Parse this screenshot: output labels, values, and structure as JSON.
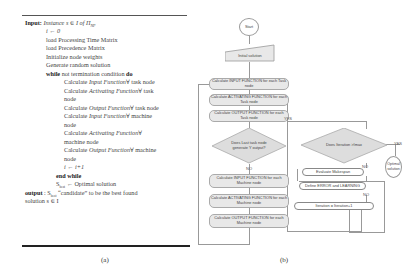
{
  "algorithm": {
    "lines": [
      {
        "kw": "Input:",
        "text": " Instance  s ∈ I of Π",
        "sub": "NP"
      },
      {
        "text": "i ← 0"
      },
      {
        "text": "load Processing Time Matrix"
      },
      {
        "text": "load Precedence Matrix"
      },
      {
        "text": "Initialize node weights"
      },
      {
        "text": "Generate random solution"
      },
      {
        "kw": "while",
        "text": "  not termination condition ",
        "kw2": "do"
      },
      {
        "pre": "Calculate ",
        "fn": "Input Function",
        "post": "∀  task node"
      },
      {
        "pre": "Calculate  ",
        "fn": "Activating  Function",
        "post": "∀    task"
      },
      {
        "text": "node"
      },
      {
        "pre": "Calculate ",
        "fn": "Output Function",
        "post": "∀  task node"
      },
      {
        "pre": "Calculate  ",
        "fn": "Input  Function",
        "post": "∀    machine"
      },
      {
        "text": "node"
      },
      {
        "pre": "Calculate        ",
        "fn": "Activating        Function",
        "post": "∀"
      },
      {
        "text": "machine node"
      },
      {
        "pre": "Calculate ",
        "fn": "Output Function",
        "post": "∀   machine"
      },
      {
        "text": "node"
      },
      {
        "text": "i ← i+1"
      },
      {
        "kw": "end while"
      },
      {
        "text": "S",
        "sub": "best",
        "text2": " ← Optimal solution"
      },
      {
        "kw": "output",
        "text": " : S",
        "sub": "best",
        "text2": "  “candidate”  to  be  the  best  found"
      },
      {
        "text": "solution s ∈ I"
      }
    ],
    "caption": "(a)"
  },
  "flowchart": {
    "start": "Start",
    "initial": "Initial solution",
    "input_task": "Calculate INPUT FUNCTION  for each Task node",
    "activating_task": "Calculate ACTIVATING FUNCTION for each Task node",
    "output_task": "Calculate OUTPUT FUNCTION for each Task node",
    "decision_last": "Does Last task node generate Y output?",
    "input_machine": "Calculate INPUT FUNCTION  for each Machine node",
    "activating_machine": "Calculate ACTIVATING FUNCTION for each Machine node",
    "output_machine": "Calculate OUTPUT FUNCTION for each Machine node",
    "decision_iter": "Does Iteration >Imax",
    "evaluate": "Evaluate Makespan",
    "define": "Define ERROR and LEARNING",
    "iteration": "Iteration = Iteration+1",
    "optimal": "Optimal solution",
    "yes": "YES",
    "no": "NO",
    "caption": "(b)"
  }
}
